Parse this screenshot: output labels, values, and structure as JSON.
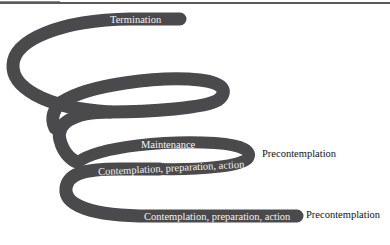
{
  "diagram": {
    "type": "spiral",
    "stages": {
      "termination": "Termination",
      "maintenance": "Maintenance",
      "cpa_upper": "Contemplation, preparation, action",
      "cpa_lower": "Contemplation, preparation, action",
      "precontemplation_upper": "Precontemplation",
      "precontemplation_lower": "Precontemplation"
    },
    "colors": {
      "band": "#4a4a4c",
      "band_text": "#f2f2f2",
      "outside_text": "#111111",
      "background": "#ffffff"
    }
  }
}
